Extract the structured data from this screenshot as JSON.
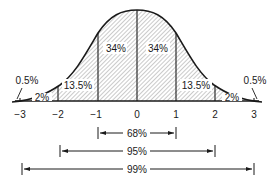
{
  "diagram": {
    "type": "normal-distribution",
    "axis": {
      "ticks": [
        "−3",
        "−2",
        "−1",
        "0",
        "1",
        "2",
        "3"
      ]
    },
    "regions": [
      {
        "id": "tail-left",
        "label": "0.5%"
      },
      {
        "id": "band-left-2",
        "label": "2%"
      },
      {
        "id": "band-left-1",
        "label": "13.5%"
      },
      {
        "id": "band-left-0",
        "label": "34%"
      },
      {
        "id": "band-right-0",
        "label": "34%"
      },
      {
        "id": "band-right-1",
        "label": "13.5%"
      },
      {
        "id": "band-right-2",
        "label": "2%"
      },
      {
        "id": "tail-right",
        "label": "0.5%"
      }
    ],
    "ranges": [
      {
        "label": "68%",
        "from": "−1",
        "to": "1"
      },
      {
        "label": "95%",
        "from": "−2",
        "to": "2"
      },
      {
        "label": "99%",
        "from": "−3",
        "to": "3"
      }
    ],
    "colors": {
      "ink": "#1a1a1a",
      "hatch": "#555555",
      "background": "#ffffff"
    }
  }
}
